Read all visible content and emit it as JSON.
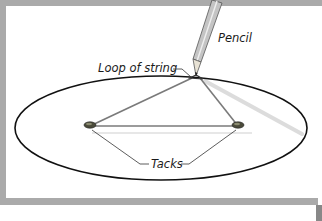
{
  "diagram": {
    "labels": {
      "pencil": "Pencil",
      "loop": "Loop of string",
      "tacks": "Tacks"
    },
    "colors": {
      "frame": "#a9a9a9",
      "ellipse": "#111111",
      "string": "#7a7a7a",
      "shadow": "#d8d8d8",
      "tack": "#4a4a3a",
      "pencil_body": "#bdbdbd"
    }
  }
}
